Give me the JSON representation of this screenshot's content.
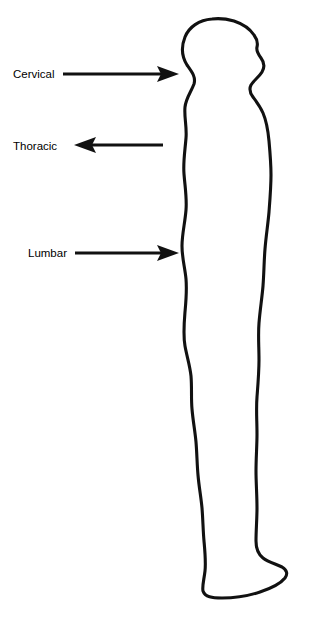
{
  "figure": {
    "background_color": "#ffffff",
    "line_color": "#111111",
    "width": 312,
    "height": 618,
    "orientation": "right-facing lateral view"
  },
  "annotations": [
    {
      "id": "cervical",
      "label": "Cervical",
      "label_x": 13,
      "label_y": 75,
      "arrow_direction": "right",
      "arrow_tail_x": 63,
      "arrow_tip_x": 179,
      "arrow_y": 74
    },
    {
      "id": "thoracic",
      "label": "Thoracic",
      "label_x": 13,
      "label_y": 147,
      "arrow_direction": "left",
      "arrow_tail_x": 163,
      "arrow_tip_x": 74,
      "arrow_y": 145
    },
    {
      "id": "lumbar",
      "label": "Lumbar",
      "label_x": 28,
      "label_y": 254,
      "arrow_direction": "right",
      "arrow_tail_x": 75,
      "arrow_tip_x": 179,
      "arrow_y": 253
    }
  ],
  "body_outline": {
    "description": "Continuous closed contour of a standing human figure seen from the left side, head at top facing right, feet at bottom pointing right",
    "path": "M 212 19 C 199 20 189 27 185 37 C 181 47 182 57 187 65 C 192 72 196 77 194 84 C 191 92 186 98 185 107 C 184 117 187 127 186 138 C 185 151 183 162 184 174 C 185 187 187 198 186 210 C 185 223 182 234 182 246 C 182 258 185 268 186 279 C 187 291 186 301 185 312 C 184 324 183 335 185 346 C 187 357 190 366 191 376 C 192 388 191 398 192 409 C 193 421 195 431 196 442 C 197 454 197 464 198 475 C 199 487 201 497 202 508 C 203 520 203 530 204 541 C 205 552 206 562 205 571 C 204 580 202 586 203 591 C 205 597 212 598 222 598 C 234 598 248 596 260 592 C 272 588 281 583 285 578 C 288 574 287 570 282 567 C 276 564 268 562 263 558 C 258 554 256 548 256 541 C 256 530 257 519 257 508 C 257 495 256 483 256 471 C 256 458 257 446 257 434 C 257 421 256 409 257 397 C 258 384 259 372 259 360 C 259 347 258 335 259 323 C 260 310 262 298 263 286 C 264 273 264 261 265 249 C 266 236 268 224 269 212 C 270 199 271 187 271 175 C 271 163 270 152 269 141 C 268 130 266 120 263 113 C 260 106 256 101 253 97 C 250 93 249 89 251 85 C 254 80 259 77 262 72 C 265 67 264 62 261 58 C 258 54 256 51 257 47 C 258 43 257 39 254 35 C 250 29 243 24 234 21 C 227 19 219 18 212 19 Z"
  }
}
